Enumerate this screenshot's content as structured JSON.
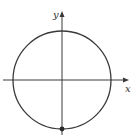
{
  "diagram": {
    "title": "",
    "axes": {
      "x_label": "x",
      "y_label": "y"
    },
    "circle": {
      "center": [
        0,
        0
      ],
      "radius": 1
    },
    "marked_point": {
      "coords": [
        0,
        -1
      ],
      "style": "filled"
    },
    "colors": {
      "stroke": "#3a3a3a",
      "text": "#333333",
      "background": "#ffffff"
    }
  }
}
